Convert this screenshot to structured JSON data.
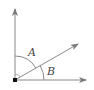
{
  "diagram": {
    "type": "angle-diagram",
    "labels": {
      "angle_a": "A",
      "angle_b": "B"
    },
    "colors": {
      "line": "#7a7a7a",
      "vertex": "#111111",
      "text": "#444444"
    },
    "rays": [
      "vertical",
      "diagonal",
      "horizontal"
    ]
  }
}
